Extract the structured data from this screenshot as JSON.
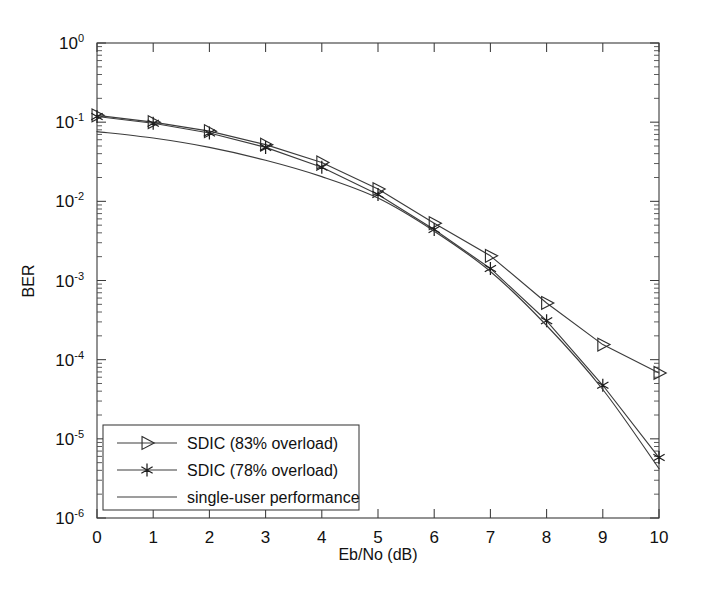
{
  "chart_data": {
    "type": "line",
    "title": "",
    "xlabel": "Eb/No (dB)",
    "ylabel": "BER",
    "xlim": [
      0,
      10
    ],
    "ylim": [
      1e-06,
      1
    ],
    "yscale": "log",
    "grid": false,
    "legend_position": "lower-left",
    "xticklabels": [
      "0",
      "1",
      "2",
      "3",
      "4",
      "5",
      "6",
      "7",
      "8",
      "9",
      "10"
    ],
    "xticks": [
      0,
      1,
      2,
      3,
      4,
      5,
      6,
      7,
      8,
      9,
      10
    ],
    "yticks": [
      1,
      0.1,
      0.01,
      0.001,
      0.0001,
      1e-05,
      1e-06
    ],
    "yticklabels": [
      {
        "mantissa": "10",
        "exponent": "0"
      },
      {
        "mantissa": "10",
        "exponent": "-1"
      },
      {
        "mantissa": "10",
        "exponent": "-2"
      },
      {
        "mantissa": "10",
        "exponent": "-3"
      },
      {
        "mantissa": "10",
        "exponent": "-4"
      },
      {
        "mantissa": "10",
        "exponent": "-5"
      },
      {
        "mantissa": "10",
        "exponent": "-6"
      }
    ],
    "x": [
      0,
      1,
      2,
      3,
      4,
      5,
      6,
      7,
      8,
      9,
      10
    ],
    "series": [
      {
        "name": "SDIC (83% overload)",
        "marker": "triangle-right",
        "values": [
          0.122,
          0.1,
          0.077,
          0.052,
          0.031,
          0.0143,
          0.0053,
          0.00205,
          0.00052,
          0.000155,
          6.8e-05
        ]
      },
      {
        "name": "SDIC (78% overload)",
        "marker": "star",
        "values": [
          0.118,
          0.097,
          0.073,
          0.048,
          0.027,
          0.0122,
          0.0044,
          0.00142,
          0.00031,
          4.75e-05,
          5.8e-06
        ]
      },
      {
        "name": "single-user performance",
        "marker": "none",
        "values": [
          0.076,
          0.063,
          0.048,
          0.033,
          0.0205,
          0.011,
          0.0042,
          0.0013,
          0.00027,
          4.2e-05,
          4.2e-06
        ]
      }
    ]
  },
  "legend": {
    "entries": [
      {
        "label": "SDIC (83% overload)",
        "marker": "triangle-right-icon"
      },
      {
        "label": "SDIC (78% overload)",
        "marker": "star-icon"
      },
      {
        "label": "single-user performance",
        "marker": "plain-line-icon"
      }
    ]
  }
}
